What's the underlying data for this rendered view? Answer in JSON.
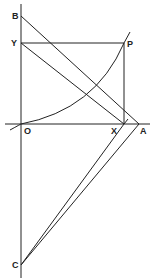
{
  "diagram": {
    "labels": {
      "B": "B",
      "Y": "Y",
      "P": "P",
      "O": "O",
      "X": "X",
      "A": "A",
      "C": "C"
    },
    "points": {
      "O": [
        21,
        124
      ],
      "B": [
        21,
        16
      ],
      "Y": [
        21,
        43
      ],
      "P": [
        124,
        43
      ],
      "X": [
        124,
        124
      ],
      "A": [
        139,
        124
      ],
      "C": [
        21,
        265
      ]
    },
    "segments": [
      [
        "B",
        "A"
      ],
      [
        "Y",
        "X"
      ],
      [
        "Y",
        "P"
      ],
      [
        "P",
        "X"
      ],
      [
        "C",
        "X"
      ],
      [
        "C",
        "A"
      ]
    ],
    "colors": {
      "line": "#222222",
      "background": "#ffffff"
    }
  }
}
